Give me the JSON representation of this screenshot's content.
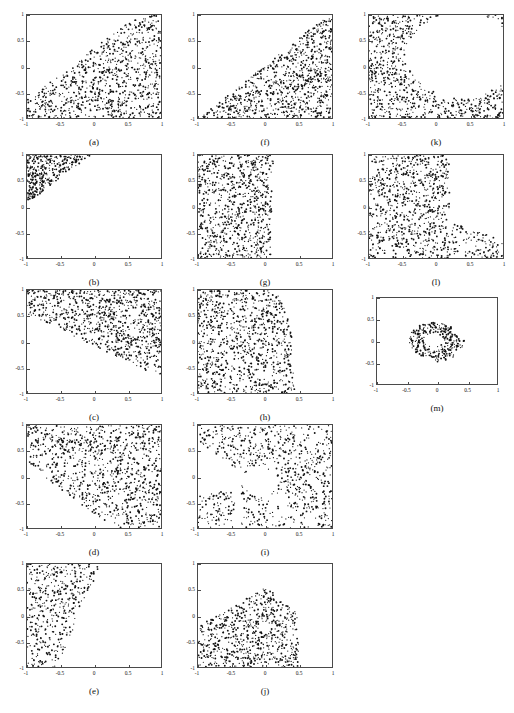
{
  "figure": {
    "width": 514,
    "height": 713,
    "background": "#ffffff",
    "point_color": "#111111",
    "axis_color": "#4a4a4a"
  },
  "axes": {
    "xlabel": "",
    "ylabel": "",
    "xlim": [
      -1,
      1
    ],
    "ylim": [
      -1,
      1
    ],
    "xticks": [
      "-1",
      "-0.5",
      "0",
      "0.5",
      "1"
    ],
    "xtick_values": [
      -1,
      -0.5,
      0,
      0.5,
      1
    ],
    "yticks": [
      "1",
      "0.5",
      "0",
      "-0.5",
      "-1"
    ],
    "ytick_values": [
      1,
      0.5,
      0,
      -0.5,
      -1
    ],
    "grid": false,
    "legend": "none"
  },
  "chart_data": [
    {
      "type": "scatter",
      "panel": "a",
      "caption": "(a)",
      "title": "",
      "xlabel": "",
      "ylabel": "",
      "xlim": [
        -1,
        1
      ],
      "ylim": [
        -1,
        1
      ],
      "grid": false,
      "legend": "none",
      "marker": "point",
      "region_description": "Dense uniform points filling the region below the line y = x + 0.35; upper-left corner empty.",
      "n_points": 900,
      "region": {
        "rule": "below-line",
        "slope": 1.0,
        "intercept": 0.35
      },
      "seed": 11
    },
    {
      "type": "scatter",
      "panel": "b",
      "caption": "(b)",
      "title": "",
      "xlabel": "",
      "ylabel": "",
      "xlim": [
        -1,
        1
      ],
      "ylim": [
        -1,
        1
      ],
      "grid": false,
      "legend": "none",
      "marker": "point",
      "region_description": "Sparse triangular cluster in the upper-left corner above the line y = x + 1.05, reaching x up to about 0.25.",
      "n_points": 330,
      "region": {
        "rule": "above-line",
        "slope": 1.0,
        "intercept": 1.05
      },
      "seed": 22
    },
    {
      "type": "scatter",
      "panel": "c",
      "caption": "(c)",
      "title": "",
      "xlabel": "",
      "ylabel": "",
      "xlim": [
        -1,
        1
      ],
      "ylim": [
        -1,
        1
      ],
      "grid": false,
      "legend": "none",
      "marker": "point",
      "region_description": "Points fill the upper band above the descending line y = -0.62x - 0.08; lower-left region is empty.",
      "n_points": 880,
      "region": {
        "rule": "above-line",
        "slope": -0.62,
        "intercept": -0.08
      },
      "seed": 33
    },
    {
      "type": "scatter",
      "panel": "d",
      "caption": "(d)",
      "title": "",
      "xlabel": "",
      "ylabel": "",
      "xlim": [
        -1,
        1
      ],
      "ylim": [
        -1,
        1
      ],
      "grid": false,
      "legend": "none",
      "marker": "point",
      "region_description": "Points fill the region above the descending line y = -0.95x - 0.72, covering most of the panel except the lower-left corner.",
      "n_points": 960,
      "region": {
        "rule": "above-line",
        "slope": -0.95,
        "intercept": -0.72
      },
      "seed": 44
    },
    {
      "type": "scatter",
      "panel": "e",
      "caption": "(e)",
      "title": "",
      "xlabel": "",
      "ylabel": "",
      "xlim": [
        -1,
        1
      ],
      "ylim": [
        -1,
        1
      ],
      "grid": false,
      "legend": "none",
      "marker": "point",
      "region_description": "Vertical wedge hugging the left edge; right boundary slants from x = 0.1 at y = 1 down to x = -0.55 at y = -1.",
      "n_points": 430,
      "region": {
        "rule": "left-of-slanted-edge",
        "x_at_ytop": 0.1,
        "x_at_ybottom": -0.55
      },
      "seed": 55
    },
    {
      "type": "scatter",
      "panel": "f",
      "caption": "(f)",
      "title": "",
      "xlabel": "",
      "ylabel": "",
      "xlim": [
        -1,
        1
      ],
      "ylim": [
        -1,
        1
      ],
      "grid": false,
      "legend": "none",
      "marker": "point",
      "region_description": "Lower-right triangle below the line y = 1.05x + 0.02; upper-left half empty.",
      "n_points": 880,
      "region": {
        "rule": "below-line",
        "slope": 1.05,
        "intercept": 0.02
      },
      "seed": 66
    },
    {
      "type": "scatter",
      "panel": "g",
      "caption": "(g)",
      "title": "",
      "xlabel": "",
      "ylabel": "",
      "xlim": [
        -1,
        1
      ],
      "ylim": [
        -1,
        1
      ],
      "grid": false,
      "legend": "none",
      "marker": "point",
      "region_description": "Vertical band covering the full height for x less than about 0.1; right portion of the panel empty.",
      "n_points": 820,
      "region": {
        "rule": "left-of-slanted-edge",
        "x_at_ytop": 0.13,
        "x_at_ybottom": 0.08
      },
      "seed": 77
    },
    {
      "type": "scatter",
      "panel": "h",
      "caption": "(h)",
      "title": "",
      "xlabel": "",
      "ylabel": "",
      "xlim": [
        -1,
        1
      ],
      "ylim": [
        -1,
        1
      ],
      "grid": false,
      "legend": "none",
      "marker": "point",
      "region_description": "Left band whose right boundary bulges outward: x = 0.18 at y = 1, x = 0.4 at y = 0, x = 0.45 at y = -1.",
      "n_points": 900,
      "region": {
        "rule": "left-of-curved-edge",
        "x_at_ytop": 0.16,
        "x_at_ymid": 0.4,
        "x_at_ybottom": 0.45
      },
      "seed": 88
    },
    {
      "type": "scatter",
      "panel": "i",
      "caption": "(i)",
      "title": "",
      "xlabel": "",
      "ylabel": "",
      "xlim": [
        -1,
        1
      ],
      "ylim": [
        -1,
        1
      ],
      "grid": false,
      "legend": "none",
      "marker": "point",
      "region_description": "Two lobes: an upper-left mass above the anti-diagonal and a lower-right band, separated by an empty diagonal corridor and a circular void near (-0.05, -0.1).",
      "n_points": 760,
      "region": {
        "rule": "anti-diagonal-split-with-hole",
        "hole_cx": -0.05,
        "hole_cy": -0.1,
        "hole_r": 0.26
      },
      "seed": 99
    },
    {
      "type": "scatter",
      "panel": "j",
      "caption": "(j)",
      "title": "",
      "xlabel": "",
      "ylabel": "",
      "xlim": [
        -1,
        1
      ],
      "ylim": [
        -1,
        1
      ],
      "grid": false,
      "legend": "none",
      "marker": "point",
      "region_description": "Mound-shaped cluster peaking near y = 0.55 at x = 0, bounded right by x = 0.5 and sloping down to the left edge.",
      "n_points": 700,
      "region": {
        "rule": "mound",
        "peak_x": 0.02,
        "peak_y": 0.55,
        "right_edge": 0.5
      },
      "seed": 101
    },
    {
      "type": "scatter",
      "panel": "k",
      "caption": "(k)",
      "title": "",
      "xlabel": "",
      "ylabel": "",
      "xlim": [
        -1,
        1
      ],
      "ylim": [
        -1,
        1
      ],
      "grid": false,
      "legend": "none",
      "marker": "point",
      "region_description": "C-shaped crescent: points along the left edge and across the bottom, with a large empty lobe centered about (0.35, 0.2).",
      "n_points": 720,
      "region": {
        "rule": "crescent-void",
        "void_cx": 0.38,
        "void_cy": 0.22,
        "void_r": 0.82
      },
      "seed": 111
    },
    {
      "type": "scatter",
      "panel": "l",
      "caption": "(l)",
      "title": "",
      "xlabel": "",
      "ylabel": "",
      "xlim": [
        -1,
        1
      ],
      "ylim": [
        -1,
        1
      ],
      "grid": false,
      "legend": "none",
      "marker": "point",
      "region_description": "L-shaped region bounded by a hyperbola-like curve: a full-height band on the left up to x = 0.2 plus a thin strip along the bottom extending to x = 1.",
      "n_points": 900,
      "region": {
        "rule": "hyperbola-corner",
        "x_knee": 0.2,
        "y_floor": -0.55
      },
      "seed": 121
    },
    {
      "type": "scatter",
      "panel": "m",
      "caption": "(m)",
      "title": "",
      "xlabel": "",
      "ylabel": "",
      "xlim": [
        -1,
        1
      ],
      "ylim": [
        -1,
        1
      ],
      "grid": false,
      "legend": "none",
      "marker": "point",
      "region_description": "Small sparse annulus (ring) centered near (-0.05, 0.02) with outer radius about 0.42 and inner radius about 0.16; slight tail toward the lower right.",
      "n_points": 300,
      "region": {
        "rule": "annulus",
        "cx": -0.05,
        "cy": 0.02,
        "r_outer": 0.42,
        "r_inner": 0.16
      },
      "seed": 131
    }
  ],
  "layout": {
    "columns": 3,
    "rows": 5,
    "panel_order": [
      [
        "a",
        "f",
        "k"
      ],
      [
        "b",
        "g",
        "l"
      ],
      [
        "c",
        "h",
        "m"
      ],
      [
        "d",
        "i",
        null
      ],
      [
        "e",
        "j",
        null
      ]
    ],
    "geometry": {
      "col_x": [
        26,
        197,
        368
      ],
      "row_y": [
        14,
        154,
        289,
        424,
        563
      ],
      "plot_w": 136,
      "plot_h": 105,
      "plot_w_m": 122,
      "plot_h_m": 88,
      "caption_dy": 18
    }
  }
}
